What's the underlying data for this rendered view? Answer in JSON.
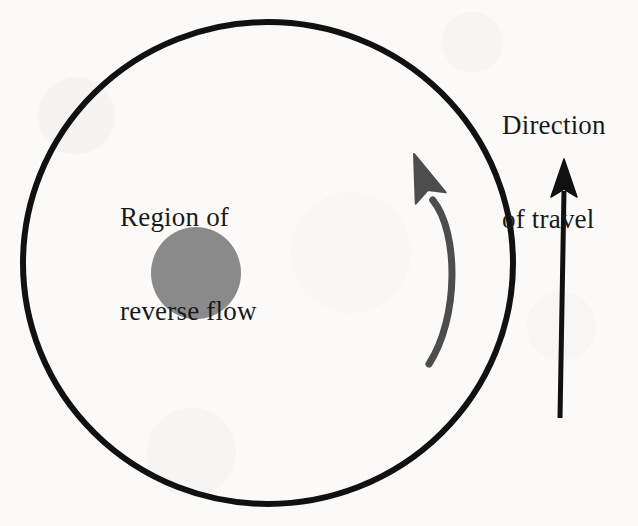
{
  "figure": {
    "background_color": "#fbfaf8",
    "labels": {
      "reverse_flow": {
        "line1": "Region of",
        "line2": "reverse flow",
        "color": "#1a1a1a"
      },
      "direction_travel": {
        "line1": "Direction",
        "line2": "of travel",
        "color": "#1a1a1a"
      }
    },
    "shapes": {
      "outer_boundary": {
        "name": "outer-circle",
        "kind": "ellipse",
        "cx": 268,
        "cy": 263,
        "rx": 245,
        "ry": 241,
        "stroke_color": "#111111",
        "stroke_width": 6,
        "fill": "none"
      },
      "reverse_flow_region": {
        "name": "gray-blob",
        "kind": "ellipse",
        "cx": 196,
        "cy": 273,
        "rx": 45,
        "ry": 46,
        "fill_color": "#8a8a8a",
        "stroke": "none"
      },
      "circulation_arrow": {
        "name": "curved-arrow",
        "kind": "curved-arrow",
        "tip_x": 414,
        "tip_y": 154,
        "tail_x": 429,
        "tail_y": 364,
        "bulge_x": 459,
        "bulge_y": 268,
        "stroke_color": "#4d4d4d",
        "stroke_width": 7,
        "head_length": 44,
        "head_width": 32
      },
      "travel_arrow": {
        "name": "straight-arrow",
        "kind": "straight-arrow",
        "tip_x": 564,
        "tip_y": 159,
        "tail_x": 560,
        "tail_y": 418,
        "stroke_color": "#111111",
        "stroke_width": 5,
        "head_length": 38,
        "head_width": 26
      }
    }
  },
  "meta": {
    "width": 638,
    "height": 526
  }
}
